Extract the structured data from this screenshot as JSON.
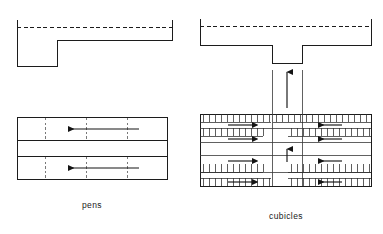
{
  "figure": {
    "background_color": "#ffffff",
    "line_color": "#1c1c1c",
    "label_color": "#1a1a1a"
  },
  "labels": {
    "pens": "pens",
    "cubicles": "cubicles"
  },
  "sections": {
    "pens": {
      "caption": "pens",
      "cross_section": {
        "name": "pens-cross-section",
        "description": "stepped floor profile with raised lying area on right and lower dunging passage on left, dashed level line across top",
        "dashed_line_label": "level line"
      },
      "plan": {
        "name": "pens-plan",
        "rows": 2,
        "row_labels": [
          "upper pen row",
          "lower pen row"
        ],
        "dividers_per_row": 3,
        "arrows": [
          {
            "id": "pens-arrow-upper",
            "direction": "left",
            "row": "upper pen row"
          },
          {
            "id": "pens-arrow-lower",
            "direction": "left",
            "row": "lower pen row"
          }
        ],
        "passage_label": "central passage"
      }
    },
    "cubicles": {
      "caption": "cubicles",
      "cross_section": {
        "name": "cubicles-cross-section",
        "description": "flat profile with central recessed dunging channel, dashed level line across top",
        "dashed_line_label": "level line"
      },
      "plan": {
        "name": "cubicles-plan",
        "cubicle_rows": 4,
        "cubicle_row_labels": [
          "top cubicle row",
          "second cubicle row",
          "third cubicle row",
          "bottom cubicle row"
        ],
        "aisle_label": "central cross aisle",
        "arrows": [
          {
            "id": "cub-arrow-1-left",
            "direction": "right",
            "side": "left"
          },
          {
            "id": "cub-arrow-1-right",
            "direction": "left",
            "side": "right"
          },
          {
            "id": "cub-arrow-2-left",
            "direction": "right",
            "side": "left"
          },
          {
            "id": "cub-arrow-2-right",
            "direction": "left",
            "side": "right"
          },
          {
            "id": "cub-arrow-3-left",
            "direction": "right",
            "side": "left"
          },
          {
            "id": "cub-arrow-3-right",
            "direction": "left",
            "side": "right"
          },
          {
            "id": "cub-arrow-4-left",
            "direction": "right",
            "side": "left"
          },
          {
            "id": "cub-arrow-4-right",
            "direction": "left",
            "side": "right"
          },
          {
            "id": "cub-arrow-aisle-top",
            "direction": "up",
            "side": "centre"
          },
          {
            "id": "cub-arrow-aisle-mid",
            "direction": "up",
            "side": "centre"
          }
        ]
      }
    }
  }
}
